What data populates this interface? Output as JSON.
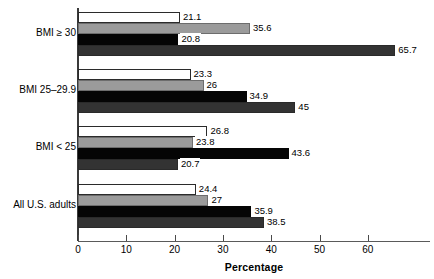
{
  "chart_data": {
    "type": "bar",
    "orientation": "horizontal",
    "title": "",
    "xlabel": "Percentage",
    "ylabel": "",
    "xlim": [
      0,
      73
    ],
    "xticks": [
      0,
      10,
      20,
      30,
      40,
      50,
      60
    ],
    "xtick_labels": [
      "0",
      "10",
      "20",
      "30",
      "40",
      "50",
      "60"
    ],
    "grid": false,
    "legend": "none",
    "categories": [
      "BMI ≥ 30",
      "BMI 25–29.9",
      "BMI < 25",
      "All U.S. adults"
    ],
    "series": [
      {
        "name": "series-1",
        "color": "#ffffff",
        "values": [
          21.1,
          23.3,
          26.8,
          24.4
        ],
        "labels": [
          "21.1",
          "23.3",
          "26.8",
          "24.4"
        ]
      },
      {
        "name": "series-2",
        "color": "#9b9b9b",
        "values": [
          35.6,
          26,
          23.8,
          27
        ],
        "labels": [
          "35.6",
          "26",
          "23.8",
          "27"
        ]
      },
      {
        "name": "series-3",
        "color": "#050505",
        "values": [
          20.8,
          34.9,
          43.6,
          35.9
        ],
        "labels": [
          "20.8",
          "34.9",
          "43.6",
          "35.9"
        ]
      },
      {
        "name": "series-4",
        "color": "#333333",
        "values": [
          65.7,
          45,
          20.7,
          38.5
        ],
        "labels": [
          "65.7",
          "45",
          "20.7",
          "38.5"
        ]
      }
    ]
  },
  "axis": {
    "x_title": "Percentage",
    "ticks": [
      "0",
      "10",
      "20",
      "30",
      "40",
      "50",
      "60"
    ]
  },
  "categories": {
    "c0": "BMI ≥ 30",
    "c1": "BMI 25–29.9",
    "c2": "BMI < 25",
    "c3": "All U.S. adults"
  }
}
